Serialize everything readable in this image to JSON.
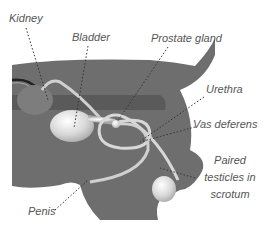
{
  "diagram": {
    "labels": {
      "kidney": "Kidney",
      "bladder": "Bladder",
      "prostate": "Prostate gland",
      "urethra": "Urethra",
      "vas_deferens": "Vas deferens",
      "testicles_line1": "Paired",
      "testicles_line2": "testicles in",
      "testicles_line3": "scrotum",
      "penis": "Penis"
    },
    "colors": {
      "body": "#6e6e6e",
      "body_band": "#5a5a5a",
      "organ_light": "#e6e6e6",
      "text": "#555555",
      "leader": "#333333"
    }
  }
}
